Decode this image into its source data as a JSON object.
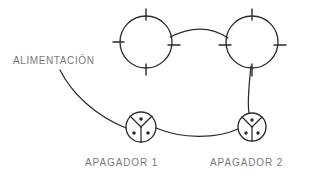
{
  "diagram": {
    "background_color": "#ffffff",
    "stroke_color": "#2b2b2b",
    "label_color": "#6f6f6f",
    "labels": {
      "supply": "ALIMENTACIÓN",
      "switch_1": "APAGADOR  1",
      "switch_2": "APAGADOR  2"
    },
    "components": [
      {
        "id": "lamp-1",
        "type": "lamp",
        "symbol": "circle-with-four-ticks",
        "cx": 146,
        "cy": 42,
        "r": 26,
        "ticks": 4
      },
      {
        "id": "lamp-2",
        "type": "lamp",
        "symbol": "circle-with-four-ticks",
        "cx": 252,
        "cy": 42,
        "r": 26,
        "ticks": 4
      },
      {
        "id": "switch-1",
        "type": "three-way-switch",
        "symbol": "circle-with-y-divider-and-three-terminals",
        "cx": 141,
        "cy": 127,
        "r": 15,
        "terminals": 3
      },
      {
        "id": "switch-2",
        "type": "three-way-switch",
        "symbol": "circle-with-y-divider-and-three-terminals",
        "cx": 252,
        "cy": 127,
        "r": 14,
        "terminals": 3
      }
    ],
    "wires": [
      {
        "id": "wire-supply-to-switch-1",
        "from": "supply",
        "to": "switch-1",
        "style": "curved"
      },
      {
        "id": "wire-switch-1-to-switch-2",
        "from": "switch-1",
        "to": "switch-2",
        "style": "curved"
      },
      {
        "id": "wire-switch-2-to-lamp-2",
        "from": "switch-2",
        "to": "lamp-2",
        "style": "straight"
      },
      {
        "id": "wire-lamp-1-to-lamp-2",
        "from": "lamp-1",
        "to": "lamp-2",
        "style": "curved"
      }
    ]
  }
}
